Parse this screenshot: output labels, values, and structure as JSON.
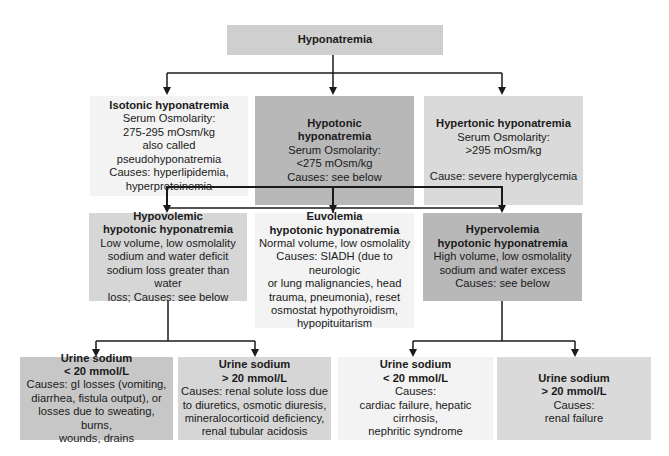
{
  "title": "Hyponatremia",
  "level1": [
    {
      "title": "Isotonic hyponatremia",
      "lines": [
        "Serum Osmolarity:",
        "275-295 mOsm/kg",
        "also called pseudohyponatremia",
        "Causes: hyperlipidemia,",
        "hyperproteinemia"
      ]
    },
    {
      "title_lines": [
        "Hypotonic",
        "hyponatremia"
      ],
      "lines": [
        "Serum Osmolarity:",
        "<275 mOsm/kg",
        "Causes: see below"
      ]
    },
    {
      "title": "Hypertonic hyponatremia",
      "lines": [
        "Serum Osmolarity:",
        ">295 mOsm/kg",
        "",
        "Cause: severe hyperglycemia"
      ]
    }
  ],
  "level2": [
    {
      "title_lines": [
        "Hypovolemic",
        "hypotonic hyponatremia"
      ],
      "lines": [
        "Low volume, low osmolality",
        "sodium and water deficit",
        "sodium loss greater than water",
        "loss; Causes: see below"
      ]
    },
    {
      "title_lines": [
        "Euvolemia",
        "hypotonic hyponatremia"
      ],
      "lines": [
        "Normal volume, low osmolality",
        "Causes: SIADH (due to neurologic",
        "or lung malignancies, head",
        "trauma, pneumonia), reset",
        "osmostat hypothyroidism,",
        "hypopituitarism"
      ]
    },
    {
      "title_lines": [
        "Hypervolemia",
        "hypotonic hyponatremia"
      ],
      "lines": [
        "High volume, low osmolality",
        "sodium and water excess",
        "Causes: see below"
      ]
    }
  ],
  "level3": [
    {
      "title_lines": [
        "Urine sodium",
        "< 20 mmol/L"
      ],
      "lines": [
        "Causes: gI losses (vomiting,",
        "diarrhea, fistula output), or",
        "losses due to sweating, burns,",
        "wounds, drains"
      ]
    },
    {
      "title_lines": [
        "Urine sodium",
        "> 20 mmol/L"
      ],
      "lines": [
        "Causes: renal solute loss due",
        "to diuretics, osmotic diuresis,",
        "mineralocorticoid deficiency,",
        "renal tubular acidosis"
      ]
    },
    {
      "title_lines": [
        "Urine sodium",
        "< 20 mmol/L"
      ],
      "lines": [
        "Causes:",
        "cardiac failure, hepatic cirrhosis,",
        "nephritic syndrome"
      ]
    },
    {
      "title_lines": [
        "Urine sodium",
        "> 20 mmol/L"
      ],
      "lines": [
        "Causes:",
        "renal failure"
      ]
    }
  ]
}
